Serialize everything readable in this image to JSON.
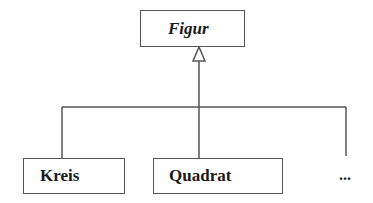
{
  "diagram": {
    "type": "uml-class-inheritance",
    "superclass": {
      "name": "Figur",
      "abstract": true
    },
    "subclasses": [
      {
        "name": "Kreis"
      },
      {
        "name": "Quadrat"
      }
    ],
    "more_indicator": "...",
    "colors": {
      "line": "#555555",
      "text": "#1a1a1a",
      "background": "#ffffff"
    }
  }
}
